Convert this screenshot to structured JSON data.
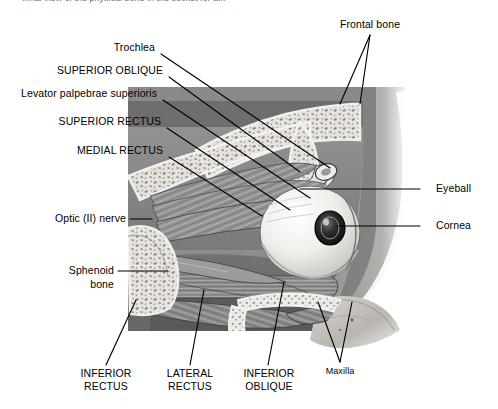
{
  "figure": {
    "title_partial": "...nal view of the physical bone in the socket for a...",
    "type": "anatomical-illustration",
    "palette": {
      "background": "#ffffff",
      "ink": "#000000",
      "bone_light": "#e9e6e0",
      "bone_mid": "#bdb9b3",
      "tissue_mid": "#8e8e8e",
      "tissue_dark": "#5c5c5c",
      "shadow": "#3a3a3a",
      "sclera": "#f2f0ec",
      "cornea_dark": "#1d1d1d"
    }
  },
  "labels": {
    "trochlea": "Trochlea",
    "superior_oblique": "SUPERIOR OBLIQUE",
    "levator": "Levator palpebrae superioris",
    "superior_rectus": "SUPERIOR RECTUS",
    "medial_rectus": "MEDIAL RECTUS",
    "optic_nerve": "Optic (II) nerve",
    "sphenoid_line1": "Sphenoid",
    "sphenoid_line2": "bone",
    "frontal_bone": "Frontal bone",
    "eyeball": "Eyeball",
    "cornea": "Cornea",
    "inferior_rectus_line1": "INFERIOR",
    "inferior_rectus_line2": "RECTUS",
    "lateral_rectus_line1": "LATERAL",
    "lateral_rectus_line2": "RECTUS",
    "inferior_oblique_line1": "INFERIOR",
    "inferior_oblique_line2": "OBLIQUE",
    "maxilla": "Maxilla"
  }
}
